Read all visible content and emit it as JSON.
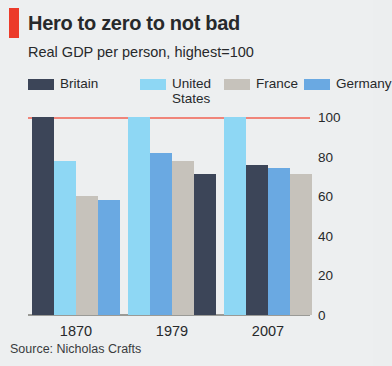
{
  "header": {
    "accent_color": "#ec3b2a",
    "title": "Hero to zero to not bad",
    "subtitle": "Real GDP per person, highest=100"
  },
  "source": "Source: Nicholas Crafts",
  "chart_data": {
    "type": "bar",
    "title": "Hero to zero to not bad",
    "subtitle": "Real GDP per person, highest=100",
    "xlabel": "",
    "ylabel": "",
    "ylim": [
      0,
      100
    ],
    "yticks": [
      0,
      20,
      40,
      60,
      80,
      100
    ],
    "ytick_labels": [
      "0",
      "20",
      "40",
      "60",
      "80",
      "100"
    ],
    "grid": false,
    "legend_position": "top",
    "categories": [
      "1870",
      "1979",
      "2007"
    ],
    "series": [
      {
        "name": "Britain",
        "color": "#3c4558",
        "values": [
          100,
          71,
          76
        ]
      },
      {
        "name": "United States",
        "color": "#8ed7f4",
        "values": [
          78,
          100,
          100
        ]
      },
      {
        "name": "France",
        "color": "#c6c2bb",
        "values": [
          60,
          78,
          71
        ]
      },
      {
        "name": "Germany",
        "color": "#6aa9e2",
        "values": [
          58,
          82,
          74
        ]
      }
    ],
    "group_order": [
      [
        "Britain",
        "United States",
        "France",
        "Germany"
      ],
      [
        "United States",
        "Germany",
        "France",
        "Britain"
      ],
      [
        "United States",
        "Britain",
        "Germany",
        "France"
      ]
    ],
    "reference_line": {
      "value": 100,
      "color": "#f0857a"
    },
    "source": "Source: Nicholas Crafts"
  }
}
